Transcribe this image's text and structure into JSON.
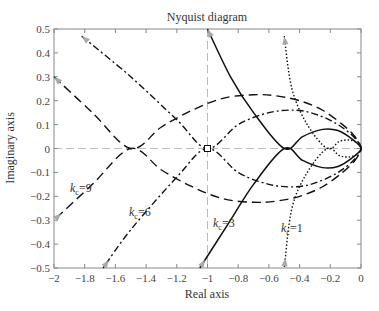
{
  "chart_data": {
    "type": "line",
    "title": "Nyquist diagram",
    "xlabel": "Real axis",
    "ylabel": "Imaginary axis",
    "xlim": [
      -2,
      0
    ],
    "ylim": [
      -0.5,
      0.5
    ],
    "xticks": [
      -2,
      -1.8,
      -1.6,
      -1.4,
      -1.2,
      -1,
      -0.8,
      -0.6,
      -0.4,
      -0.2,
      0
    ],
    "xtick_labels": [
      "-2",
      "-1.8",
      "-1.6",
      "-1.4",
      "-1.2",
      "-1",
      "-0.8",
      "-0.6",
      "-0.4",
      "-0.2",
      "0"
    ],
    "yticks": [
      0.5,
      0.4,
      0.3,
      0.2,
      0.1,
      0,
      -0.1,
      -0.2,
      -0.3,
      -0.4,
      -0.5
    ],
    "ytick_labels": [
      "0.5",
      "0.4",
      "0.3",
      "0.2",
      "0.1",
      "0",
      "-0.1",
      "-0.2",
      "-0.3",
      "-0.4",
      "-0.5"
    ],
    "grid": false,
    "reference_lines": {
      "real_axis_y": 0,
      "critical_x": -1,
      "critical_point": [
        -1,
        0
      ]
    },
    "series": [
      {
        "name": "k_c=9",
        "style": "dashed",
        "x": [
          -2,
          -1.75,
          -1.5,
          -1.3,
          -1.1,
          -0.9,
          -0.7,
          -0.55,
          -0.4,
          -0.25,
          -0.12,
          -0.04,
          0,
          -0.04,
          -0.12,
          -0.25,
          -0.4,
          -0.55,
          -0.7,
          -0.9,
          -1.1,
          -1.3,
          -1.5,
          -1.75,
          -2
        ],
        "y": [
          0.3,
          0.15,
          0,
          0.09,
          0.16,
          0.21,
          0.225,
          0.22,
          0.2,
          0.16,
          0.1,
          0.05,
          0,
          -0.05,
          -0.1,
          -0.16,
          -0.2,
          -0.22,
          -0.225,
          -0.21,
          -0.16,
          -0.09,
          0,
          -0.15,
          -0.3
        ]
      },
      {
        "name": "k_c=6",
        "style": "dash-dot",
        "x": [
          -1.82,
          -1.5,
          -1.2,
          -1,
          -0.8,
          -0.6,
          -0.42,
          -0.28,
          -0.15,
          -0.05,
          0,
          -0.05,
          -0.15,
          -0.28,
          -0.42,
          -0.6,
          -0.8,
          -1,
          -1.2,
          -1.5,
          -1.68
        ],
        "y": [
          0.47,
          0.3,
          0.12,
          0,
          0.1,
          0.15,
          0.16,
          0.14,
          0.1,
          0.05,
          0,
          -0.05,
          -0.1,
          -0.14,
          -0.16,
          -0.15,
          -0.1,
          0,
          -0.12,
          -0.34,
          -0.5
        ]
      },
      {
        "name": "k_c=3",
        "style": "solid",
        "x": [
          -1.0,
          -0.85,
          -0.7,
          -0.5,
          -0.38,
          -0.25,
          -0.15,
          -0.06,
          0,
          -0.06,
          -0.15,
          -0.25,
          -0.38,
          -0.5,
          -0.7,
          -0.85,
          -1.05
        ],
        "y": [
          0.5,
          0.3,
          0.15,
          0,
          0.05,
          0.08,
          0.075,
          0.04,
          0,
          -0.04,
          -0.075,
          -0.08,
          -0.05,
          0,
          -0.15,
          -0.3,
          -0.5
        ]
      },
      {
        "name": "k_c=1",
        "style": "dotted",
        "x": [
          -0.5,
          -0.45,
          -0.35,
          -0.22,
          -0.14,
          -0.07,
          -0.02,
          0,
          -0.02,
          -0.07,
          -0.14,
          -0.22,
          -0.35,
          -0.45,
          -0.5
        ],
        "y": [
          0.47,
          0.25,
          0.1,
          0,
          0.03,
          0.035,
          0.02,
          0,
          -0.02,
          -0.035,
          -0.03,
          0,
          -0.1,
          -0.25,
          -0.5
        ]
      }
    ],
    "annotations": [
      {
        "text": "k_c=9",
        "x": -1.88,
        "y": -0.17
      },
      {
        "text": "k_c=6",
        "x": -1.58,
        "y": -0.26
      },
      {
        "text": "k_c=3",
        "x": -0.97,
        "y": -0.4
      },
      {
        "text": "k_c=1",
        "x": -0.47,
        "y": -0.42
      }
    ]
  },
  "labels": {
    "title": "Nyquist diagram",
    "xlabel": "Real axis",
    "ylabel": "Imaginary axis",
    "k9": {
      "k": "k",
      "sub": "c",
      "val": "=9"
    },
    "k6": {
      "k": "k",
      "sub": "c",
      "val": "=6"
    },
    "k3": {
      "k": "k",
      "sub": "c",
      "val": "=3"
    },
    "k1": {
      "k": "k",
      "sub": "c",
      "val": "=1"
    }
  }
}
